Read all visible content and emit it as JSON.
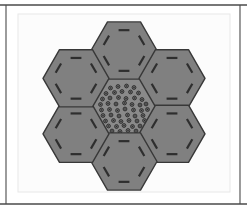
{
  "figure": {
    "title": "Hexagonal honeycomb array diagram",
    "width": 247,
    "height": 213
  },
  "colors": {
    "page_background": "#ffffff",
    "panel_background": "#fcfcfc",
    "panel_border": "#e8e8e8",
    "frame_rule": "#4a4a4a",
    "hex_fill": "#808080",
    "hex_stroke": "#383838",
    "hex_dash": "#2e2e2e",
    "center_hex_fill": "#8a8a8a",
    "dot_stroke": "#2b2b2b",
    "dot_fill": "#6e6e6e"
  },
  "frame": {
    "top_rule": {
      "x1": 0,
      "y1": 5,
      "x2": 247,
      "y2": 5,
      "width": 1.6
    },
    "bottom_rule": {
      "x1": 0,
      "y1": 204,
      "x2": 247,
      "y2": 204,
      "width": 1.6
    },
    "left_rule": {
      "x1": 6,
      "y1": 5,
      "x2": 6,
      "y2": 204,
      "width": 1.1
    },
    "right_rule": {
      "x1": 240,
      "y1": 5,
      "x2": 240,
      "y2": 204,
      "width": 1.1
    }
  },
  "panel": {
    "x": 18,
    "y": 14,
    "width": 212,
    "height": 178
  },
  "layout": {
    "center_x": 124,
    "center_y": 106,
    "hex_radius": 33,
    "hex_orientation": "flat-top",
    "ring_spacing": 55.5,
    "tile_count": 7,
    "dash_inset": 9.5,
    "dash_length_fraction": 0.46,
    "dash_width": 2.2
  },
  "tiles": [
    {
      "id": "center",
      "name": "center-tile",
      "label": "Center tile",
      "cx": 124,
      "cy": 106,
      "pattern": "dots",
      "angle_deg": 0
    },
    {
      "id": "top",
      "name": "top-tile",
      "label": "Top tile",
      "cx": 124,
      "cy": 50.5,
      "pattern": "dashes",
      "angle_deg": 0
    },
    {
      "id": "upper-right",
      "name": "upper-right-tile",
      "label": "Upper right tile",
      "cx": 172,
      "cy": 78.3,
      "pattern": "dashes",
      "angle_deg": 0
    },
    {
      "id": "lower-right",
      "name": "lower-right-tile",
      "label": "Lower right tile",
      "cx": 172,
      "cy": 133.8,
      "pattern": "dashes",
      "angle_deg": 0
    },
    {
      "id": "bottom",
      "name": "bottom-tile",
      "label": "Bottom tile",
      "cx": 124,
      "cy": 161.5,
      "pattern": "dashes",
      "angle_deg": 0
    },
    {
      "id": "lower-left",
      "name": "lower-left-tile",
      "label": "Lower left tile",
      "cx": 76,
      "cy": 133.8,
      "pattern": "dashes",
      "angle_deg": 0
    },
    {
      "id": "upper-left",
      "name": "upper-left-tile",
      "label": "Upper left tile",
      "cx": 76,
      "cy": 78.3,
      "pattern": "dashes",
      "angle_deg": 0
    }
  ],
  "center_dots": {
    "count": 54,
    "radius": 1.9,
    "inner_radius": 0.75,
    "stroke_width": 0.9,
    "positions": [
      [
        110.5,
        88.0
      ],
      [
        118.0,
        86.5
      ],
      [
        126.5,
        86.0
      ],
      [
        134.0,
        87.5
      ],
      [
        106.0,
        93.5
      ],
      [
        114.5,
        92.5
      ],
      [
        122.0,
        91.5
      ],
      [
        130.5,
        92.0
      ],
      [
        138.5,
        93.0
      ],
      [
        102.5,
        99.0
      ],
      [
        110.0,
        98.0
      ],
      [
        118.5,
        97.5
      ],
      [
        126.0,
        98.5
      ],
      [
        134.5,
        98.0
      ],
      [
        142.0,
        99.5
      ],
      [
        100.5,
        104.5
      ],
      [
        108.0,
        103.5
      ],
      [
        116.0,
        104.0
      ],
      [
        124.5,
        103.0
      ],
      [
        132.0,
        104.5
      ],
      [
        140.0,
        105.0
      ],
      [
        146.0,
        104.0
      ],
      [
        101.5,
        110.0
      ],
      [
        109.5,
        109.5
      ],
      [
        117.5,
        110.5
      ],
      [
        125.0,
        109.0
      ],
      [
        133.5,
        110.0
      ],
      [
        141.5,
        110.5
      ],
      [
        147.5,
        109.5
      ],
      [
        103.0,
        115.5
      ],
      [
        111.0,
        115.0
      ],
      [
        119.0,
        116.0
      ],
      [
        127.5,
        115.0
      ],
      [
        135.0,
        116.0
      ],
      [
        143.0,
        115.5
      ],
      [
        105.5,
        121.0
      ],
      [
        113.5,
        120.5
      ],
      [
        121.0,
        121.5
      ],
      [
        129.0,
        120.5
      ],
      [
        137.0,
        121.0
      ],
      [
        144.5,
        120.5
      ],
      [
        108.5,
        126.0
      ],
      [
        116.5,
        126.5
      ],
      [
        124.0,
        125.5
      ],
      [
        132.5,
        126.5
      ],
      [
        140.0,
        126.0
      ],
      [
        112.0,
        131.0
      ],
      [
        120.0,
        131.5
      ],
      [
        128.0,
        130.5
      ],
      [
        136.0,
        131.0
      ],
      [
        116.0,
        136.0
      ],
      [
        124.0,
        136.5
      ],
      [
        131.5,
        135.5
      ],
      [
        121.0,
        140.5
      ]
    ]
  }
}
